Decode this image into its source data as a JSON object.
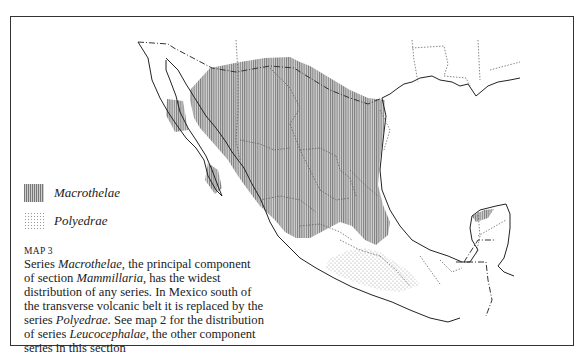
{
  "map": {
    "number_label": "MAP 3",
    "legend": [
      {
        "pattern": "vertical-hatch",
        "label": "Macrothelae"
      },
      {
        "pattern": "stipple",
        "label": "Polyedrae"
      }
    ],
    "caption": {
      "parts": [
        {
          "text": "Series ",
          "italic": false
        },
        {
          "text": "Macrothelae",
          "italic": true
        },
        {
          "text": ", the principal component of section ",
          "italic": false
        },
        {
          "text": "Mammillaria",
          "italic": true
        },
        {
          "text": ", has the widest distribution of any series. In Mexico south of the transverse volcanic belt it is replaced by the series ",
          "italic": false
        },
        {
          "text": "Polyedrae",
          "italic": true
        },
        {
          "text": ". See map 2 for the distribution of series ",
          "italic": false
        },
        {
          "text": "Leucocephalae",
          "italic": true
        },
        {
          "text": ", the other component series in this section",
          "italic": false
        }
      ]
    },
    "colors": {
      "hatch": "#777777",
      "hatch_bg": "#cfcfcf",
      "stipple": "#999999",
      "outline": "#222222",
      "border": "#333333"
    }
  }
}
